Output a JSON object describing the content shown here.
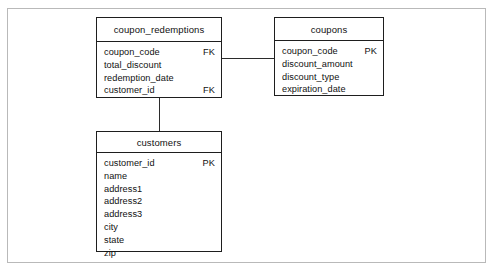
{
  "diagram": {
    "colors": {
      "frame": "#b9b9b9",
      "entity_border": "#1e1e1e",
      "text": "#111111",
      "connector": "#2b2b2b",
      "background": "#ffffff"
    },
    "entities": [
      {
        "id": "coupon_redemptions",
        "name": "coupon_redemptions",
        "fields": [
          {
            "name": "coupon_code",
            "key": "FK"
          },
          {
            "name": "total_discount",
            "key": ""
          },
          {
            "name": "redemption_date",
            "key": ""
          },
          {
            "name": "customer_id",
            "key": "FK"
          }
        ]
      },
      {
        "id": "coupons",
        "name": "coupons",
        "fields": [
          {
            "name": "coupon_code",
            "key": "PK"
          },
          {
            "name": "discount_amount",
            "key": ""
          },
          {
            "name": "discount_type",
            "key": ""
          },
          {
            "name": "expiration_date",
            "key": ""
          }
        ]
      },
      {
        "id": "customers",
        "name": "customers",
        "fields": [
          {
            "name": "customer_id",
            "key": "PK"
          },
          {
            "name": "name",
            "key": ""
          },
          {
            "name": "address1",
            "key": ""
          },
          {
            "name": "address2",
            "key": ""
          },
          {
            "name": "address3",
            "key": ""
          },
          {
            "name": "city",
            "key": ""
          },
          {
            "name": "state",
            "key": ""
          },
          {
            "name": "zip",
            "key": ""
          }
        ]
      }
    ],
    "relationships": [
      {
        "id": "redemptions-to-coupons",
        "from": "coupon_redemptions",
        "to": "coupons"
      },
      {
        "id": "redemptions-to-customers",
        "from": "coupon_redemptions",
        "to": "customers"
      }
    ]
  }
}
